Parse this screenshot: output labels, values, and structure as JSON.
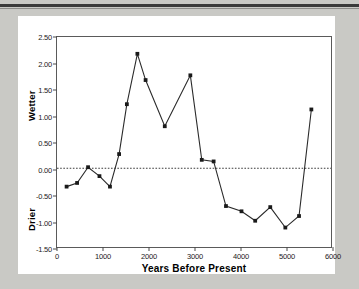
{
  "figure": {
    "background": "#c9c9c5",
    "panel_background": "#ffffff",
    "line_color": "#2a2a2a",
    "marker_color": "#1a1a1a",
    "axis_color": "#5a5a5a"
  },
  "chart_data": {
    "type": "line",
    "title": "",
    "subtitle": "",
    "xlabel": "Years Before Present",
    "ylabel": "",
    "ylabel_top": "Wetter",
    "ylabel_bottom": "Drier",
    "xlim": [
      0,
      6000
    ],
    "ylim": [
      -1.5,
      2.5
    ],
    "xticks": [
      0,
      1000,
      2000,
      3000,
      4000,
      5000,
      6000
    ],
    "xtick_labels": [
      "0",
      "1000",
      "2000",
      "3000",
      "4000",
      "5000",
      "6000"
    ],
    "yticks": [
      2.5,
      2.0,
      1.5,
      1.0,
      0.5,
      0.0,
      -0.5,
      -1.0,
      -1.5
    ],
    "ytick_labels": [
      "2.50",
      "2.00",
      "1.50",
      "1.00",
      "0.50",
      "0.00",
      "-0.50",
      "-1.00",
      "-1.50"
    ],
    "grid": false,
    "legend": null,
    "reference_line": {
      "y": 0.0,
      "style": "dotted",
      "color": "#3a3a3a"
    },
    "marker": "square",
    "series": [
      {
        "name": "moisture index",
        "x": [
          210,
          440,
          680,
          930,
          1160,
          1360,
          1530,
          1760,
          1940,
          2360,
          2920,
          3170,
          3430,
          3700,
          4040,
          4340,
          4670,
          5000,
          5300,
          5570
        ],
        "values": [
          -0.35,
          -0.28,
          0.02,
          -0.15,
          -0.35,
          0.27,
          1.22,
          2.18,
          1.68,
          0.8,
          1.77,
          0.16,
          0.13,
          -0.72,
          -0.82,
          -1.0,
          -0.74,
          -1.13,
          -0.91,
          1.12
        ]
      }
    ]
  }
}
